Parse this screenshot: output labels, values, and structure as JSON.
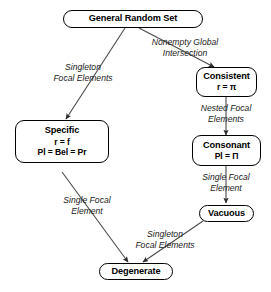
{
  "diagram": {
    "background": "#ffffff",
    "line_color": "#3a3a3a",
    "node_border_color": "#000000",
    "nodes": [
      {
        "id": "general_random_set",
        "lines": [
          "General Random Set"
        ]
      },
      {
        "id": "consistent",
        "lines": [
          "Consistent",
          "r = π"
        ]
      },
      {
        "id": "specific",
        "lines": [
          "Specific",
          "r = f",
          "Pl = Bel = Pr"
        ]
      },
      {
        "id": "consonant",
        "lines": [
          "Consonant",
          "Pl = Π"
        ]
      },
      {
        "id": "vacuous",
        "lines": [
          "Vacuous"
        ]
      },
      {
        "id": "degenerate",
        "lines": [
          "Degenerate"
        ]
      }
    ],
    "edge_labels": [
      {
        "id": "grs_to_specific",
        "lines": [
          "Singleton",
          "Focal Elements"
        ]
      },
      {
        "id": "grs_to_consistent",
        "lines": [
          "Nonempty Global",
          "Intersection"
        ]
      },
      {
        "id": "consistent_to_consonant",
        "lines": [
          "Nested Focal",
          "Elements"
        ]
      },
      {
        "id": "consonant_to_vacuous",
        "lines": [
          "Single Focal",
          "Element"
        ]
      },
      {
        "id": "specific_to_degenerate",
        "lines": [
          "Single Focal",
          "Element"
        ]
      },
      {
        "id": "vacuous_to_degenerate",
        "lines": [
          "Singleton",
          "Focal Elements"
        ]
      }
    ]
  }
}
